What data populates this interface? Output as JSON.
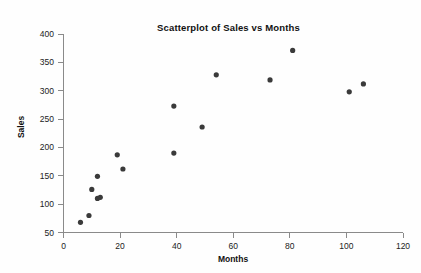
{
  "chart_data": {
    "type": "scatter",
    "title": "Scatterplot of Sales vs Months",
    "xlabel": "Months",
    "ylabel": "Sales",
    "xlim": [
      0,
      120
    ],
    "ylim": [
      50,
      400
    ],
    "xticks": [
      0,
      20,
      40,
      60,
      80,
      100,
      120
    ],
    "yticks": [
      50,
      100,
      150,
      200,
      250,
      300,
      350,
      400
    ],
    "grid": false,
    "legend": null,
    "marker_color": "#3a3a3a",
    "series": [
      {
        "name": "Sales",
        "points": [
          {
            "x": 6,
            "y": 68
          },
          {
            "x": 9,
            "y": 80
          },
          {
            "x": 10,
            "y": 126
          },
          {
            "x": 12,
            "y": 110
          },
          {
            "x": 12,
            "y": 149
          },
          {
            "x": 13,
            "y": 112
          },
          {
            "x": 19,
            "y": 187
          },
          {
            "x": 21,
            "y": 162
          },
          {
            "x": 39,
            "y": 190
          },
          {
            "x": 39,
            "y": 273
          },
          {
            "x": 49,
            "y": 236
          },
          {
            "x": 54,
            "y": 328
          },
          {
            "x": 73,
            "y": 319
          },
          {
            "x": 81,
            "y": 371
          },
          {
            "x": 101,
            "y": 298
          },
          {
            "x": 106,
            "y": 312
          }
        ]
      }
    ]
  }
}
